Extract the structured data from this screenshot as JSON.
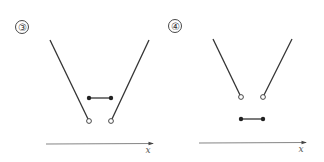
{
  "panels": [
    {
      "label": "③",
      "axis_label": "x",
      "description": "Two rays descending toward open endpoints; filled-dot segment lies above the open endpoints"
    },
    {
      "label": "④",
      "axis_label": "x",
      "description": "Two rays descending toward open endpoints; filled-dot segment lies below the open endpoints"
    }
  ],
  "colors": {
    "line": "#333333",
    "axis": "#666666",
    "background": "#ffffff"
  }
}
